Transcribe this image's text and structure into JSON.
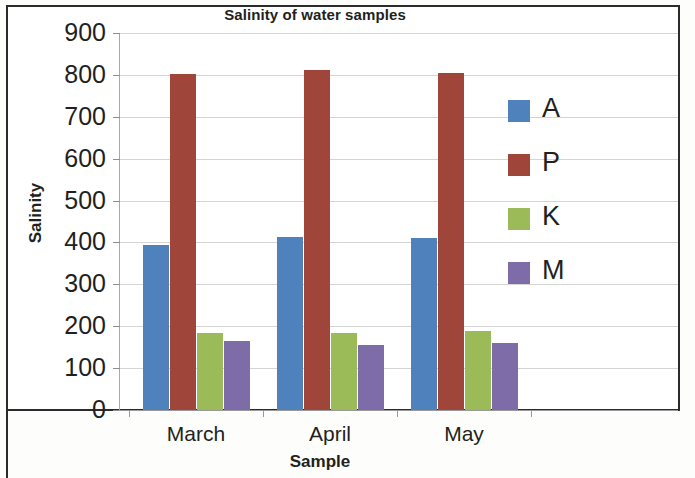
{
  "chart_data": {
    "type": "bar",
    "title": "Salinity of water samples",
    "xlabel": "Sample",
    "ylabel": "Salinity",
    "categories": [
      "March",
      "April",
      "May"
    ],
    "series": [
      {
        "name": "A",
        "color": "#4f81bd",
        "values": [
          393,
          413,
          411
        ]
      },
      {
        "name": "P",
        "color": "#a0453a",
        "values": [
          803,
          812,
          804
        ]
      },
      {
        "name": "K",
        "color": "#9bbb59",
        "values": [
          185,
          183,
          188
        ]
      },
      {
        "name": "M",
        "color": "#7e6ca8",
        "values": [
          165,
          155,
          159
        ]
      }
    ],
    "ylim": [
      0,
      900
    ],
    "ytick_labels": [
      "900",
      "800",
      "700",
      "600",
      "500",
      "400",
      "300",
      "200",
      "100",
      "0"
    ],
    "ytick_values": [
      900,
      800,
      700,
      600,
      500,
      400,
      300,
      200,
      100,
      0
    ],
    "grid": true,
    "legend_position": "right",
    "legend_entries": [
      "A",
      "P",
      "K",
      "M"
    ]
  }
}
